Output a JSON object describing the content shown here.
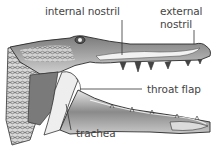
{
  "diagram": {
    "labels": {
      "internal_nostril": "internal nostril",
      "external_nostril_line1": "external",
      "external_nostril_line2": "nostril",
      "throat_flap": "throat flap",
      "trachea": "trachea"
    },
    "colors": {
      "label_text": "#444444",
      "leader_line": "#333333",
      "outline": "#2a2a2a",
      "shade_dark": "#6a6a6a",
      "shade_mid": "#a8a8a8",
      "shade_light": "#e6e6e6"
    }
  }
}
